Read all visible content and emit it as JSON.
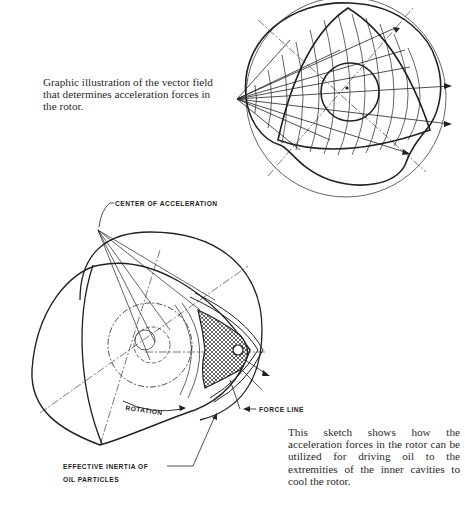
{
  "figures": [
    {
      "id": "vector-field",
      "caption": "Graphic illustration of the vector field that determines acceleration forces in the rotor."
    },
    {
      "id": "oil-cooling-sketch",
      "caption": "This sketch shows how the acceleration forces in the rotor can be utilized for driving oil to the extremities of the inner cavities to cool the rotor.",
      "labels": {
        "center": "CENTER OF ACCELERATION",
        "rotation": "ROTATION",
        "force_line": "FORCE LINE",
        "inertia_line1": "EFFECTIVE INERTIA OF",
        "inertia_line2": "OIL PARTICLES"
      }
    }
  ]
}
